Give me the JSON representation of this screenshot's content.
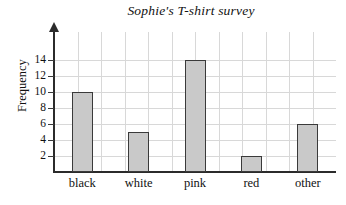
{
  "chart_data": {
    "type": "bar",
    "title": "Sophie's T-shirt survey",
    "xlabel": "",
    "ylabel": "Frequency",
    "categories": [
      "black",
      "white",
      "pink",
      "red",
      "other"
    ],
    "values": [
      10,
      5,
      14,
      2,
      6
    ],
    "yticks": [
      2,
      4,
      6,
      8,
      10,
      12,
      14
    ],
    "ytick_labels": [
      "2",
      "4",
      "6",
      "8",
      "10",
      "12",
      "14"
    ],
    "ylim": [
      0,
      15.5
    ],
    "grid": "both",
    "legend": "none",
    "bar_fill_color": "#c9c9c9",
    "bar_edge_color": "#3a3a3a",
    "grid_color": "#d8d8d8",
    "axis_color": "#2b2b2b",
    "background_color": "#ffffff"
  }
}
